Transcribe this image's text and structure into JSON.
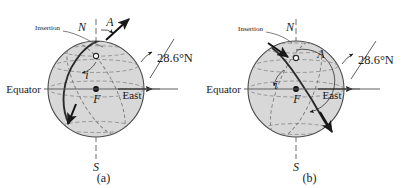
{
  "figure": {
    "type": "orbital-insertion-geometry-diagram",
    "panels": [
      {
        "caption": "(a)",
        "orbit_direction": "ascending-northeast",
        "labels": {
          "north_pole": "N",
          "south_pole": "S",
          "equator": "Equator",
          "east": "East",
          "insertion": "Insertion",
          "azimuth": "A",
          "inclination": "i",
          "focus": "F",
          "latitude": "28.6°N"
        }
      },
      {
        "caption": "(b)",
        "orbit_direction": "descending-southeast",
        "labels": {
          "north_pole": "N",
          "south_pole": "S",
          "equator": "Equator",
          "east": "East",
          "insertion": "Insertion",
          "azimuth": "A",
          "inclination": "i",
          "focus": "F",
          "latitude": "28.6°N"
        }
      }
    ],
    "colors": {
      "sphere_fill": "#d8d8d8",
      "sphere_stroke": "#4a4a4a",
      "orbit_stroke": "#2b2b2b",
      "dashed_stroke": "#8a8a8a",
      "axis_stroke": "#6e6e6e",
      "text": "#1a1a1a",
      "background": "#ffffff"
    }
  }
}
